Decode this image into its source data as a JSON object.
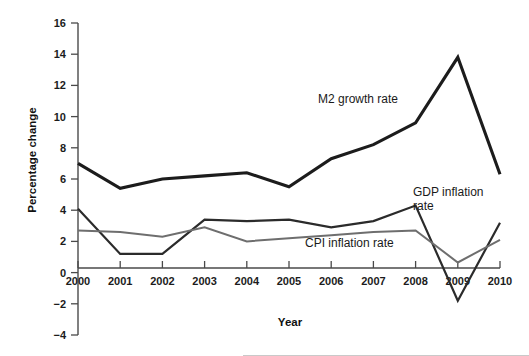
{
  "figure": {
    "background_color": "#ffffff",
    "bottom_rule_color": "#c9c9c9"
  },
  "axes": {
    "x_axis_title": "Year",
    "y_axis_title": "Percentage change",
    "x_tick_labels": [
      "2000",
      "2001",
      "2002",
      "2003",
      "2004",
      "2005",
      "2006",
      "2007",
      "2008",
      "2009",
      "2010"
    ],
    "y_tick_labels": [
      "16",
      "14",
      "12",
      "10",
      "8",
      "6",
      "4",
      "2",
      "0",
      "-2",
      "-4"
    ],
    "axis_color": "#4a4a4a"
  },
  "annotations": [
    {
      "id": "m2-growth-rate",
      "text": "M2 growth rate",
      "x": 318,
      "y": 103
    },
    {
      "id": "gdp-inflation-rate-line1",
      "text": "GDP inflation",
      "x": 413,
      "y": 196
    },
    {
      "id": "gdp-inflation-rate-line2",
      "text": "rate",
      "x": 413,
      "y": 210
    },
    {
      "id": "cpi-inflation-rate",
      "text": "CPI inflation rate",
      "x": 305,
      "y": 247
    }
  ],
  "chart_data": {
    "type": "line",
    "title": "",
    "subtitle": "",
    "xlabel": "Year",
    "ylabel": "Percentage change",
    "xlim": [
      2000,
      2010
    ],
    "ylim": [
      -4,
      16
    ],
    "y_ticks": [
      -4,
      -2,
      0,
      2,
      4,
      6,
      8,
      10,
      12,
      14,
      16
    ],
    "grid": false,
    "legend": "inline-annotations",
    "x": [
      2000,
      2001,
      2002,
      2003,
      2004,
      2005,
      2006,
      2007,
      2008,
      2009,
      2010
    ],
    "categories": [
      "2000",
      "2001",
      "2002",
      "2003",
      "2004",
      "2005",
      "2006",
      "2007",
      "2008",
      "2009",
      "2010"
    ],
    "series": [
      {
        "name": "M2 growth rate",
        "color": "#1c1c1c",
        "line_width": 3.1,
        "values": [
          7.0,
          5.4,
          6.0,
          6.2,
          6.4,
          5.5,
          7.3,
          8.2,
          9.6,
          13.8,
          6.3
        ]
      },
      {
        "name": "GDP inflation rate",
        "color": "#2b2b2b",
        "line_width": 2.2,
        "values": [
          4.1,
          1.2,
          1.2,
          3.4,
          3.3,
          3.4,
          2.9,
          3.3,
          4.3,
          -1.8,
          3.2
        ]
      },
      {
        "name": "CPI inflation rate",
        "color": "#6e6e6e",
        "line_width": 2.0,
        "values": [
          2.7,
          2.6,
          2.3,
          2.9,
          2.0,
          2.2,
          2.4,
          2.6,
          2.7,
          0.65,
          2.1
        ]
      }
    ]
  },
  "geometry": {
    "plot_left": 78,
    "plot_right": 500,
    "y_top_px": 23,
    "y_top_val": 16,
    "y_bottom_px": 335,
    "y_bottom_val": -4,
    "x_axis_title_x": 290,
    "x_axis_title_y": 326,
    "y_axis_title_x": 36,
    "y_axis_title_y": 160
  }
}
